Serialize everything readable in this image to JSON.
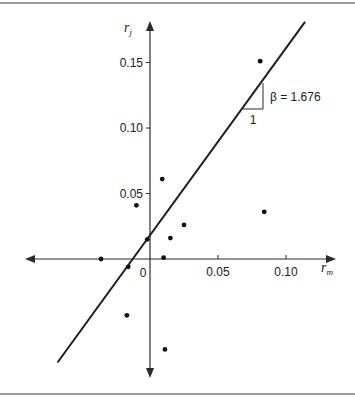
{
  "chart_data": {
    "type": "scatter",
    "title": "",
    "xlabel": "r_m",
    "ylabel": "r_j",
    "xlabel_main": "r",
    "xlabel_sub": "m",
    "ylabel_main": "r",
    "ylabel_sub": "j",
    "x_ticks": [
      {
        "value": 0.05,
        "label": "0.05"
      },
      {
        "value": 0.1,
        "label": "0.10"
      }
    ],
    "y_ticks": [
      {
        "value": 0.05,
        "label": "0.05"
      },
      {
        "value": 0.1,
        "label": "0.10"
      },
      {
        "value": 0.15,
        "label": "0.15"
      }
    ],
    "origin_label": "0",
    "xlim": [
      -0.092,
      0.135
    ],
    "ylim": [
      -0.091,
      0.17
    ],
    "grid": false,
    "legend": null,
    "points": [
      {
        "x": 0.081,
        "y": 0.151
      },
      {
        "x": 0.009,
        "y": 0.061
      },
      {
        "x": -0.01,
        "y": 0.041
      },
      {
        "x": 0.025,
        "y": 0.026
      },
      {
        "x": 0.015,
        "y": 0.016
      },
      {
        "x": -0.002,
        "y": 0.015
      },
      {
        "x": -0.036,
        "y": 0.0
      },
      {
        "x": 0.01,
        "y": 0.001
      },
      {
        "x": -0.016,
        "y": -0.006
      },
      {
        "x": 0.084,
        "y": 0.036
      },
      {
        "x": -0.017,
        "y": -0.043
      },
      {
        "x": 0.011,
        "y": -0.069
      }
    ],
    "regression_line": {
      "x1": -0.068,
      "y1": -0.079,
      "x2": 0.114,
      "y2": 0.181
    },
    "annotations": {
      "beta_label": "β = 1.676",
      "run_label": "1"
    }
  }
}
